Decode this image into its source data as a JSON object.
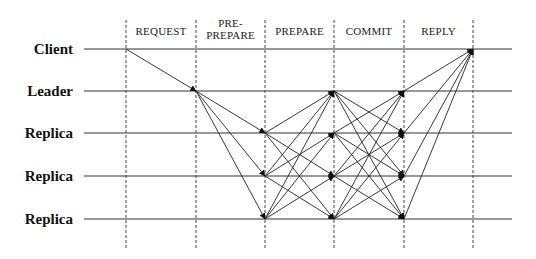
{
  "diagram": {
    "nodes": [
      {
        "label": "Client",
        "y": 49
      },
      {
        "label": "Leader",
        "y": 91
      },
      {
        "label": "Replica",
        "y": 133
      },
      {
        "label": "Replica",
        "y": 176
      },
      {
        "label": "Replica",
        "y": 219
      }
    ],
    "phases": [
      {
        "label_lines": [
          "REQUEST"
        ],
        "x_start": 126,
        "x_end": 196
      },
      {
        "label_lines": [
          "PRE-",
          "PREPARE"
        ],
        "x_start": 196,
        "x_end": 265
      },
      {
        "label_lines": [
          "PREPARE"
        ],
        "x_start": 265,
        "x_end": 334
      },
      {
        "label_lines": [
          "COMMIT"
        ],
        "x_start": 334,
        "x_end": 404
      },
      {
        "label_lines": [
          "REPLY"
        ],
        "x_start": 404,
        "x_end": 473
      }
    ],
    "dividers_x": [
      126,
      196,
      265,
      334,
      404,
      473
    ],
    "timeline_x_start": 84,
    "timeline_x_end": 512,
    "divider_y_start": 20,
    "divider_y_end": 248,
    "messages": {
      "request": [
        {
          "from": 0,
          "to": 1
        }
      ],
      "pre_prepare": [
        {
          "from": 1,
          "to": 2
        },
        {
          "from": 1,
          "to": 3
        },
        {
          "from": 1,
          "to": 4
        }
      ],
      "prepare": "all-to-all among nodes 1-4 (excluding leader as sender to self)",
      "commit": "all-to-all among nodes 1-4",
      "reply": [
        {
          "from": 1,
          "to": 0
        },
        {
          "from": 2,
          "to": 0
        },
        {
          "from": 3,
          "to": 0
        },
        {
          "from": 4,
          "to": 0
        }
      ]
    },
    "colors": {
      "line": "#222222",
      "background": "#ffffff"
    }
  }
}
